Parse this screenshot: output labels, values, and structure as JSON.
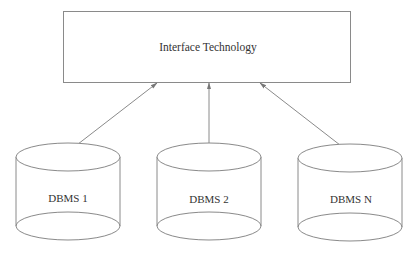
{
  "diagram": {
    "type": "architecture",
    "top_box": {
      "label": "Interface Technology",
      "x": 63,
      "y": 11,
      "w": 288,
      "h": 71
    },
    "databases": [
      {
        "label": "DBMS 1",
        "cx": 68,
        "rx": 52,
        "top_cy": 157,
        "bottom_cy": 226,
        "ry": 14
      },
      {
        "label": "DBMS 2",
        "cx": 209,
        "rx": 52,
        "top_cy": 157,
        "bottom_cy": 226,
        "ry": 14
      },
      {
        "label": "DBMS N",
        "cx": 350,
        "rx": 52,
        "top_cy": 158,
        "bottom_cy": 227,
        "ry": 14
      }
    ],
    "connections": [
      {
        "from": "Interface Technology",
        "to": "DBMS 1",
        "bidirectional": true
      },
      {
        "from": "Interface Technology",
        "to": "DBMS 2",
        "bidirectional": true
      },
      {
        "from": "Interface Technology",
        "to": "DBMS N",
        "bidirectional": true
      }
    ],
    "colors": {
      "stroke": "#8a8a8a",
      "text": "#333333",
      "background": "#ffffff"
    }
  }
}
